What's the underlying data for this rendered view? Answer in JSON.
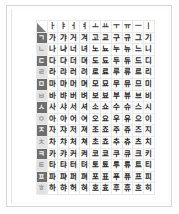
{
  "document": {
    "title": "Hangul Syllable Chart",
    "page_background": "#ffffff",
    "page_border_color": "#d8d8d8"
  },
  "chart_data": {
    "type": "table",
    "corner_label": "",
    "columns": [
      "ㅏ",
      "ㅑ",
      "ㅓ",
      "ㅕ",
      "ㅗ",
      "ㅛ",
      "ㅜ",
      "ㅠ",
      "ㅡ",
      "ㅣ"
    ],
    "row_headers": [
      "ㄱ",
      "ㄴ",
      "ㄷ",
      "ㄹ",
      "ㅁ",
      "ㅂ",
      "ㅅ",
      "ㅇ",
      "ㅈ",
      "ㅊ",
      "ㅋ",
      "ㅌ",
      "ㅍ",
      "ㅎ"
    ],
    "rows": [
      {
        "consonant": "ㄱ",
        "shade": "dark",
        "syllables": [
          "가",
          "갸",
          "거",
          "겨",
          "고",
          "교",
          "구",
          "규",
          "그",
          "기"
        ]
      },
      {
        "consonant": "ㄴ",
        "shade": "light",
        "syllables": [
          "나",
          "냐",
          "너",
          "녀",
          "노",
          "뇨",
          "누",
          "뉴",
          "느",
          "니"
        ]
      },
      {
        "consonant": "ㄷ",
        "shade": "dark",
        "syllables": [
          "다",
          "댜",
          "더",
          "뎌",
          "도",
          "됴",
          "두",
          "듀",
          "드",
          "디"
        ]
      },
      {
        "consonant": "ㄹ",
        "shade": "light",
        "syllables": [
          "라",
          "랴",
          "러",
          "려",
          "로",
          "료",
          "루",
          "류",
          "르",
          "리"
        ]
      },
      {
        "consonant": "ㅁ",
        "shade": "dark",
        "syllables": [
          "마",
          "먀",
          "머",
          "며",
          "모",
          "묘",
          "무",
          "뮤",
          "므",
          "미"
        ]
      },
      {
        "consonant": "ㅂ",
        "shade": "light",
        "syllables": [
          "바",
          "뱌",
          "버",
          "벼",
          "보",
          "뵤",
          "부",
          "뷰",
          "브",
          "비"
        ]
      },
      {
        "consonant": "ㅅ",
        "shade": "dark",
        "syllables": [
          "사",
          "샤",
          "서",
          "셔",
          "소",
          "쇼",
          "수",
          "슈",
          "스",
          "시"
        ]
      },
      {
        "consonant": "ㅇ",
        "shade": "light",
        "syllables": [
          "아",
          "야",
          "어",
          "여",
          "오",
          "요",
          "우",
          "유",
          "으",
          "이"
        ]
      },
      {
        "consonant": "ㅈ",
        "shade": "dark",
        "syllables": [
          "자",
          "쟈",
          "저",
          "져",
          "조",
          "죠",
          "주",
          "쥬",
          "즈",
          "지"
        ]
      },
      {
        "consonant": "ㅊ",
        "shade": "light",
        "syllables": [
          "차",
          "챠",
          "처",
          "쳐",
          "초",
          "쵸",
          "추",
          "츄",
          "츠",
          "치"
        ]
      },
      {
        "consonant": "ㅋ",
        "shade": "dark",
        "syllables": [
          "카",
          "캬",
          "커",
          "켜",
          "코",
          "쿄",
          "쿠",
          "큐",
          "크",
          "키"
        ]
      },
      {
        "consonant": "ㅌ",
        "shade": "light",
        "syllables": [
          "타",
          "탸",
          "터",
          "텨",
          "토",
          "툐",
          "투",
          "튜",
          "트",
          "티"
        ]
      },
      {
        "consonant": "ㅍ",
        "shade": "dark",
        "syllables": [
          "파",
          "퍄",
          "퍼",
          "펴",
          "포",
          "표",
          "푸",
          "퓨",
          "프",
          "피"
        ]
      },
      {
        "consonant": "ㅎ",
        "shade": "light",
        "syllables": [
          "하",
          "햐",
          "허",
          "혀",
          "호",
          "효",
          "후",
          "휴",
          "흐",
          "히"
        ]
      }
    ]
  },
  "colors": {
    "header_shade_dark": "#6e6e6e",
    "header_shade_light": "#e2e2e2",
    "grid_line": "#e9e9e9",
    "text": "#2a2a2a"
  }
}
